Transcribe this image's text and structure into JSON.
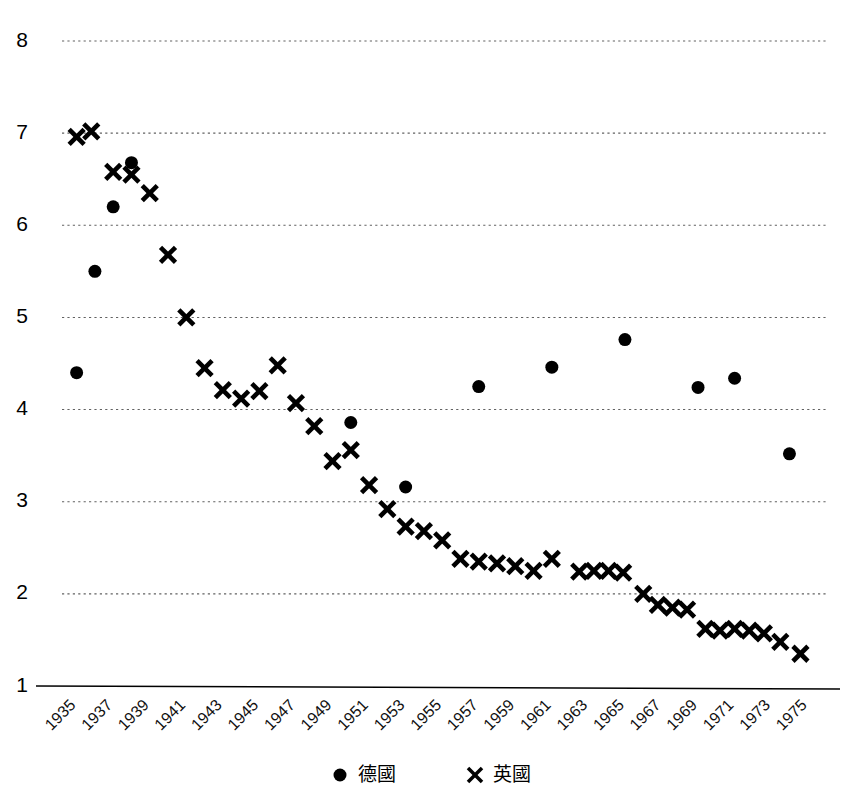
{
  "chart_data": {
    "type": "scatter",
    "title": "",
    "subtitle": "",
    "xlabel": "",
    "ylabel": "",
    "xlim": [
      1934.2,
      1976.0
    ],
    "ylim": [
      1,
      8
    ],
    "grid": true,
    "grid_axis": "y",
    "legend_position": "bottom-center",
    "y_ticks": [
      1,
      2,
      3,
      4,
      5,
      6,
      7,
      8
    ],
    "y_tick_labels": [
      "1",
      "2",
      "3",
      "4",
      "5",
      "6",
      "7",
      "8"
    ],
    "x_ticks": [
      1935,
      1937,
      1939,
      1941,
      1943,
      1945,
      1947,
      1949,
      1951,
      1953,
      1955,
      1957,
      1959,
      1961,
      1963,
      1965,
      1967,
      1969,
      1971,
      1973,
      1975
    ],
    "x_tick_labels": [
      "1935",
      "1937",
      "1939",
      "1941",
      "1943",
      "1945",
      "1947",
      "1949",
      "1951",
      "1953",
      "1955",
      "1957",
      "1959",
      "1961",
      "1963",
      "1965",
      "1967",
      "1969",
      "1971",
      "1973",
      "1975"
    ],
    "x_tick_rotation": 45,
    "series": [
      {
        "name": "德國",
        "marker": "circle",
        "color": "#000000",
        "marker_size": 13,
        "points": [
          {
            "x": 1935,
            "y": 4.4
          },
          {
            "x": 1936,
            "y": 5.5
          },
          {
            "x": 1937,
            "y": 6.2
          },
          {
            "x": 1938,
            "y": 6.68
          },
          {
            "x": 1950,
            "y": 3.86
          },
          {
            "x": 1953,
            "y": 3.16
          },
          {
            "x": 1957,
            "y": 4.25
          },
          {
            "x": 1961,
            "y": 4.46
          },
          {
            "x": 1965,
            "y": 4.76
          },
          {
            "x": 1969,
            "y": 4.24
          },
          {
            "x": 1971,
            "y": 4.34
          },
          {
            "x": 1974,
            "y": 3.52
          }
        ]
      },
      {
        "name": "英國",
        "marker": "x",
        "color": "#000000",
        "marker_size": 15,
        "points": [
          {
            "x": 1935.0,
            "y": 6.96
          },
          {
            "x": 1935.8,
            "y": 7.02
          },
          {
            "x": 1937.0,
            "y": 6.58
          },
          {
            "x": 1938.0,
            "y": 6.55
          },
          {
            "x": 1939.0,
            "y": 6.35
          },
          {
            "x": 1940.0,
            "y": 5.68
          },
          {
            "x": 1941.0,
            "y": 5.0
          },
          {
            "x": 1942.0,
            "y": 4.45
          },
          {
            "x": 1943.0,
            "y": 4.21
          },
          {
            "x": 1944.0,
            "y": 4.12
          },
          {
            "x": 1945.0,
            "y": 4.2
          },
          {
            "x": 1946.0,
            "y": 4.48
          },
          {
            "x": 1947.0,
            "y": 4.07
          },
          {
            "x": 1948.0,
            "y": 3.82
          },
          {
            "x": 1949.0,
            "y": 3.44
          },
          {
            "x": 1950.0,
            "y": 3.56
          },
          {
            "x": 1951.0,
            "y": 3.18
          },
          {
            "x": 1952.0,
            "y": 2.92
          },
          {
            "x": 1953.0,
            "y": 2.73
          },
          {
            "x": 1954.0,
            "y": 2.68
          },
          {
            "x": 1955.0,
            "y": 2.58
          },
          {
            "x": 1956.0,
            "y": 2.38
          },
          {
            "x": 1957.0,
            "y": 2.35
          },
          {
            "x": 1958.0,
            "y": 2.33
          },
          {
            "x": 1959.0,
            "y": 2.3
          },
          {
            "x": 1960.0,
            "y": 2.25
          },
          {
            "x": 1961.0,
            "y": 2.38
          },
          {
            "x": 1962.5,
            "y": 2.24
          },
          {
            "x": 1963.3,
            "y": 2.25
          },
          {
            "x": 1964.1,
            "y": 2.25
          },
          {
            "x": 1964.9,
            "y": 2.23
          },
          {
            "x": 1966.0,
            "y": 2.0
          },
          {
            "x": 1966.8,
            "y": 1.88
          },
          {
            "x": 1967.6,
            "y": 1.85
          },
          {
            "x": 1968.4,
            "y": 1.83
          },
          {
            "x": 1969.4,
            "y": 1.62
          },
          {
            "x": 1970.2,
            "y": 1.6
          },
          {
            "x": 1971.0,
            "y": 1.62
          },
          {
            "x": 1971.8,
            "y": 1.6
          },
          {
            "x": 1972.6,
            "y": 1.57
          },
          {
            "x": 1973.5,
            "y": 1.48
          },
          {
            "x": 1974.6,
            "y": 1.35
          }
        ]
      }
    ]
  },
  "legend": {
    "items": [
      {
        "label": "德國",
        "marker": "circle"
      },
      {
        "label": "英國",
        "marker": "x"
      }
    ]
  }
}
